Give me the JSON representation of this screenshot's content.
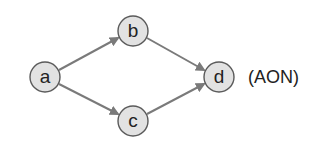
{
  "diagram": {
    "type": "activity-on-node network",
    "caption": "(AON)",
    "nodes": [
      {
        "id": "a",
        "label": "a",
        "cx": 45,
        "cy": 77
      },
      {
        "id": "b",
        "label": "b",
        "cx": 133,
        "cy": 31
      },
      {
        "id": "c",
        "label": "c",
        "cx": 133,
        "cy": 121
      },
      {
        "id": "d",
        "label": "d",
        "cx": 219,
        "cy": 77
      }
    ],
    "edges": [
      {
        "from": "a",
        "to": "b"
      },
      {
        "from": "a",
        "to": "c"
      },
      {
        "from": "b",
        "to": "d"
      },
      {
        "from": "c",
        "to": "d"
      }
    ],
    "colors": {
      "node_fill": "#e2e2e2",
      "node_stroke": "#5a5a5a",
      "edge": "#7a7a7a",
      "text": "#222222"
    }
  }
}
